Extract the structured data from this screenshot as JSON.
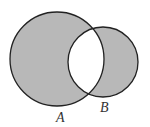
{
  "diagram": {
    "type": "venn",
    "shaded_region": "symmetric difference (A minus B union B minus A)",
    "colors": {
      "shade": "#b8b8b8",
      "stroke": "#222222",
      "background": "#ffffff"
    },
    "sets": [
      {
        "label": "A",
        "cx": 57,
        "cy": 59,
        "r": 47
      },
      {
        "label": "B",
        "cx": 103,
        "cy": 62,
        "r": 35
      }
    ]
  }
}
